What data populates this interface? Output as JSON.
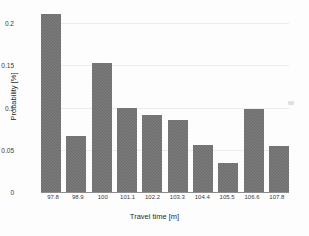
{
  "chart_data": {
    "type": "bar",
    "title": "",
    "xlabel": "Travel time [m]",
    "ylabel": "Probability [%]",
    "categories": [
      "97.8",
      "98.9",
      "100",
      "101.1",
      "102.2",
      "103.3",
      "104.4",
      "105.5",
      "106.6",
      "107.8"
    ],
    "values": [
      0.218,
      0.068,
      0.158,
      0.103,
      0.094,
      0.088,
      0.058,
      0.036,
      0.102,
      0.056
    ],
    "ylim": [
      0,
      0.225
    ],
    "yticks": [
      "0",
      "0.05",
      "0.1",
      "0.15",
      "0.2"
    ],
    "ytick_values": [
      0,
      0.05,
      0.1,
      0.15,
      0.2
    ],
    "grid": true,
    "legend": "none",
    "bar_color": "#6b6b6b"
  },
  "axes": {
    "x_title": "Travel time [m]",
    "y_title": "Probability [%]"
  }
}
